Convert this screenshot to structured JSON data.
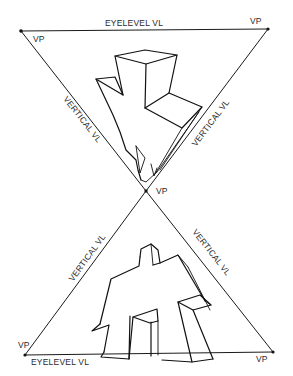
{
  "diagram": {
    "labels": {
      "eyelevel_top": "EYELEVEL VL",
      "eyelevel_bottom": "EYELEVEL VL",
      "vertical_top_left": "VERTICAL VL",
      "vertical_top_right": "VERTICAL VL",
      "vertical_bottom_left": "VERTICAL VL",
      "vertical_bottom_right": "VERTICAL VL",
      "vp_top_left": "VP",
      "vp_top_right": "VP",
      "vp_center": "VP",
      "vp_bottom_left": "VP",
      "vp_bottom_right": "VP"
    },
    "vanishing_points": [
      {
        "name": "top-left",
        "x": 21,
        "y": 31
      },
      {
        "name": "top-right",
        "x": 268,
        "y": 29
      },
      {
        "name": "center",
        "x": 146,
        "y": 191
      },
      {
        "name": "bottom-left",
        "x": 25,
        "y": 355
      },
      {
        "name": "bottom-right",
        "x": 273,
        "y": 352
      }
    ],
    "colors": {
      "line": "#111111",
      "text": "#2a2a2a",
      "background": "#ffffff"
    }
  }
}
